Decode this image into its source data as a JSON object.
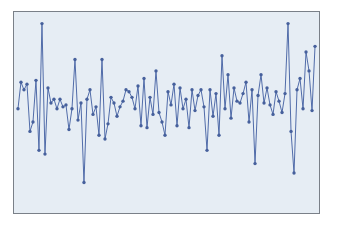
{
  "figure": {
    "background_color": "#ffffff",
    "plot_background_color": "#e6edf4",
    "frame_color": "#7a8088",
    "series_color": "#4f6aa8",
    "marker_color": "#46609c"
  },
  "chart_data": {
    "type": "line",
    "title": "",
    "subtitle": "",
    "xlabel": "",
    "ylabel": "",
    "grid": false,
    "legend": null,
    "legend_position": "none",
    "axis_ticks_visible": false,
    "axis_labels_visible": false,
    "markers": "filled-circle",
    "marker_size": 2,
    "line_width": 1,
    "xlim": [
      0,
      99
    ],
    "ylim": [
      0,
      100
    ],
    "x": [
      0,
      1,
      2,
      3,
      4,
      5,
      6,
      7,
      8,
      9,
      10,
      11,
      12,
      13,
      14,
      15,
      16,
      17,
      18,
      19,
      20,
      21,
      22,
      23,
      24,
      25,
      26,
      27,
      28,
      29,
      30,
      31,
      32,
      33,
      34,
      35,
      36,
      37,
      38,
      39,
      40,
      41,
      42,
      43,
      44,
      45,
      46,
      47,
      48,
      49,
      50,
      51,
      52,
      53,
      54,
      55,
      56,
      57,
      58,
      59,
      60,
      61,
      62,
      63,
      64,
      65,
      66,
      67,
      68,
      69,
      70,
      71,
      72,
      73,
      74,
      75,
      76,
      77,
      78,
      79,
      80,
      81,
      82,
      83,
      84,
      85,
      86,
      87,
      88,
      89,
      90,
      91,
      92,
      93,
      94,
      95,
      96,
      97,
      98,
      99
    ],
    "series": [
      {
        "name": "series-1",
        "values": [
          52,
          66,
          62,
          65,
          40,
          45,
          67,
          30,
          97,
          28,
          63,
          55,
          57,
          52,
          57,
          53,
          54,
          41,
          52,
          78,
          46,
          55,
          13,
          57,
          62,
          49,
          53,
          38,
          78,
          36,
          44,
          58,
          55,
          48,
          53,
          56,
          62,
          61,
          58,
          52,
          64,
          43,
          68,
          42,
          58,
          49,
          72,
          50,
          45,
          38,
          61,
          54,
          65,
          43,
          63,
          52,
          57,
          42,
          62,
          51,
          59,
          62,
          53,
          30,
          62,
          48,
          60,
          38,
          80,
          52,
          70,
          47,
          63,
          56,
          55,
          60,
          66,
          45,
          62,
          23,
          59,
          70,
          55,
          63,
          54,
          49,
          61,
          56,
          50,
          60,
          97,
          40,
          18,
          62,
          68,
          52,
          82,
          72,
          51,
          85
        ]
      }
    ]
  }
}
